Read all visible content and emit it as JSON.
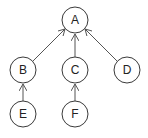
{
  "diagram": {
    "type": "tree",
    "nodes": [
      {
        "id": "A",
        "label": "A",
        "cx": 75,
        "cy": 20
      },
      {
        "id": "B",
        "label": "B",
        "cx": 23,
        "cy": 70
      },
      {
        "id": "C",
        "label": "C",
        "cx": 75,
        "cy": 70
      },
      {
        "id": "D",
        "label": "D",
        "cx": 127,
        "cy": 70
      },
      {
        "id": "E",
        "label": "E",
        "cx": 23,
        "cy": 114
      },
      {
        "id": "F",
        "label": "F",
        "cx": 75,
        "cy": 114
      }
    ],
    "edges": [
      {
        "from": "B",
        "to": "A"
      },
      {
        "from": "C",
        "to": "A"
      },
      {
        "from": "D",
        "to": "A"
      },
      {
        "from": "E",
        "to": "B"
      },
      {
        "from": "F",
        "to": "C"
      }
    ],
    "node_radius": 13,
    "colors": {
      "stroke": "#3a3a3a",
      "edge": "#555555",
      "text": "#222222",
      "background": "#ffffff"
    }
  }
}
